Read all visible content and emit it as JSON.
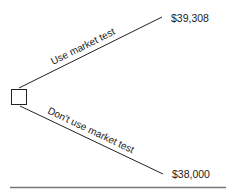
{
  "diagram": {
    "type": "decision-tree",
    "decision_node": {
      "shape": "square"
    },
    "branches": [
      {
        "label": "Use market test",
        "payoff": "$39,308"
      },
      {
        "label": "Don't use market test",
        "payoff": "$38,000"
      }
    ]
  },
  "colors": {
    "line": "#222222",
    "rule": "#777777",
    "background": "#ffffff"
  }
}
